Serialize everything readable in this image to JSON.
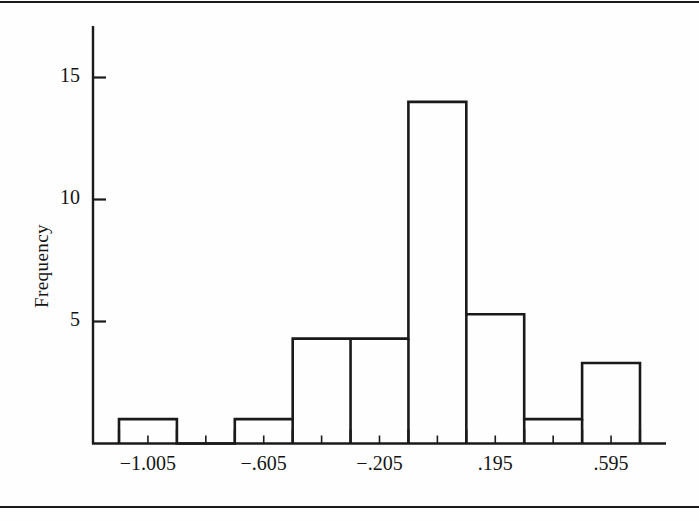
{
  "figure": {
    "background_color": "#fefefe",
    "line_color": "#1a1a1a",
    "has_top_rule": true,
    "has_bottom_rule": true
  },
  "chart_data": {
    "type": "bar",
    "subtype": "histogram",
    "title": "",
    "subtitle": "",
    "xlabel": "",
    "ylabel": "Frequency",
    "grid": false,
    "legend": null,
    "xlim": [
      -1.205,
      0.795
    ],
    "ylim": [
      0,
      17
    ],
    "ytick_labels": [
      "15",
      "10",
      "5"
    ],
    "ytick_values": [
      15,
      10,
      5
    ],
    "xtick_labels": [
      "−1.005",
      "−.605",
      "−.205",
      ".195",
      ".595"
    ],
    "xtick_values": [
      -1.005,
      -0.605,
      -0.205,
      0.195,
      0.595
    ],
    "bin_width": 0.2,
    "bin_edges": [
      -1.105,
      -0.905,
      -0.705,
      -0.505,
      -0.305,
      -0.105,
      0.095,
      0.295,
      0.495,
      0.695
    ],
    "categories": [
      "-1.105 to -0.905",
      "-0.905 to -0.705",
      "-0.705 to -0.505",
      "-0.505 to -0.305",
      "-0.305 to -0.105",
      "-0.105 to 0.095",
      "0.095 to 0.295",
      "0.295 to 0.495",
      "0.495 to 0.695"
    ],
    "bars": [
      {
        "x0": -1.105,
        "x1": -0.905,
        "value": 1
      },
      {
        "x0": -0.905,
        "x1": -0.705,
        "value": 0
      },
      {
        "x0": -0.705,
        "x1": -0.505,
        "value": 1
      },
      {
        "x0": -0.505,
        "x1": -0.305,
        "value": 4.3
      },
      {
        "x0": -0.305,
        "x1": -0.105,
        "value": 4.3
      },
      {
        "x0": -0.105,
        "x1": 0.095,
        "value": 14
      },
      {
        "x0": 0.095,
        "x1": 0.295,
        "value": 5.3
      },
      {
        "x0": 0.295,
        "x1": 0.495,
        "value": 1
      },
      {
        "x0": 0.495,
        "x1": 0.695,
        "value": 3.3
      }
    ],
    "values": [
      1,
      0,
      1,
      4.3,
      4.3,
      14,
      5.3,
      1,
      3.3
    ]
  }
}
